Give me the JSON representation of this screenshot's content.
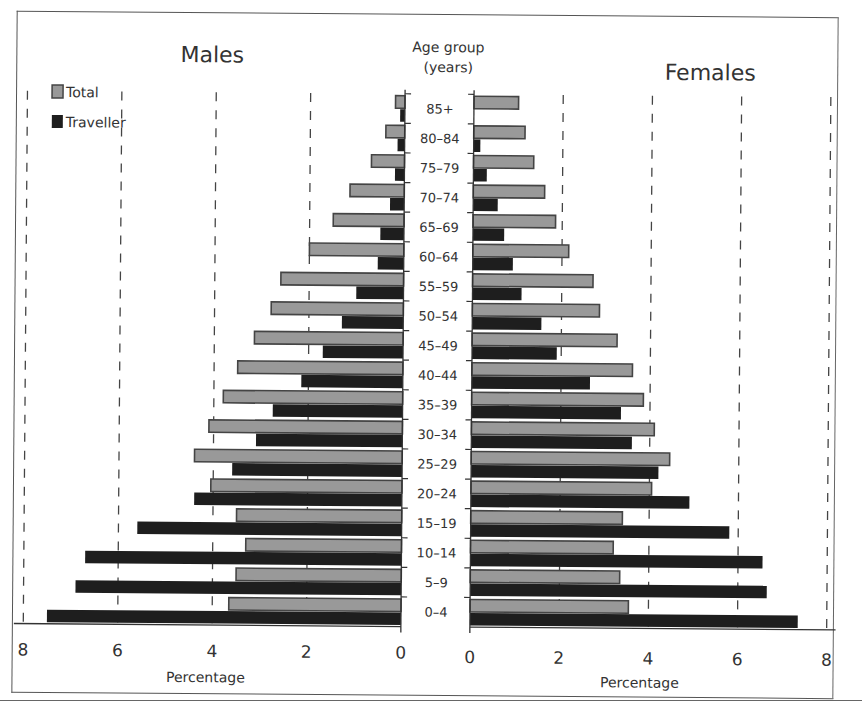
{
  "chart_data": {
    "type": "bar",
    "subtype": "population-pyramid",
    "title": "",
    "panels": [
      "Males",
      "Females"
    ],
    "center_label": "Age group (years)",
    "categories": [
      "85+",
      "80–84",
      "75–79",
      "70–74",
      "65–69",
      "60–64",
      "55–59",
      "50–54",
      "45–49",
      "40–44",
      "35–39",
      "30–34",
      "25–29",
      "20–24",
      "15–19",
      "10–14",
      "5–9",
      "0–4"
    ],
    "series": [
      {
        "name": "Males Total",
        "panel": "Males",
        "group": "Total",
        "values": [
          0.2,
          0.4,
          0.7,
          1.15,
          1.5,
          2.0,
          2.6,
          2.8,
          3.15,
          3.5,
          3.8,
          4.1,
          4.4,
          4.05,
          3.5,
          3.3,
          3.5,
          3.65
        ]
      },
      {
        "name": "Males Traveller",
        "panel": "Males",
        "group": "Traveller",
        "values": [
          0.1,
          0.15,
          0.2,
          0.3,
          0.5,
          0.55,
          1.0,
          1.3,
          1.7,
          2.15,
          2.75,
          3.1,
          3.6,
          4.4,
          5.6,
          6.7,
          6.9,
          7.5
        ]
      },
      {
        "name": "Females Total",
        "panel": "Females",
        "group": "Total",
        "values": [
          1.0,
          1.15,
          1.35,
          1.6,
          1.85,
          2.15,
          2.7,
          2.85,
          3.25,
          3.6,
          3.85,
          4.1,
          4.45,
          4.05,
          3.4,
          3.2,
          3.35,
          3.55
        ]
      },
      {
        "name": "Females Traveller",
        "panel": "Females",
        "group": "Traveller",
        "values": [
          0.0,
          0.15,
          0.3,
          0.55,
          0.7,
          0.9,
          1.1,
          1.55,
          1.9,
          2.65,
          3.35,
          3.6,
          4.2,
          4.9,
          5.8,
          6.55,
          6.65,
          7.35
        ]
      }
    ],
    "xlabel": "Percentage",
    "ylabel": "Age group (years)",
    "xlim": [
      0,
      8
    ],
    "xticks": [
      0,
      2,
      4,
      6,
      8
    ],
    "grid": "vertical dashed at 2, 4, 6, 8",
    "legend": {
      "position": "top-left",
      "entries": [
        "Total",
        "Traveller"
      ]
    },
    "colors": {
      "Total": "#999999",
      "Traveller": "#1e1e1e",
      "bar_edge": "#444444"
    }
  },
  "labels": {
    "males": "Males",
    "females": "Females",
    "age_group_line1": "Age group",
    "age_group_line2": "(years)",
    "xlabel_left": "Percentage",
    "xlabel_right": "Percentage",
    "legend_total": "Total",
    "legend_traveller": "Traveller"
  }
}
